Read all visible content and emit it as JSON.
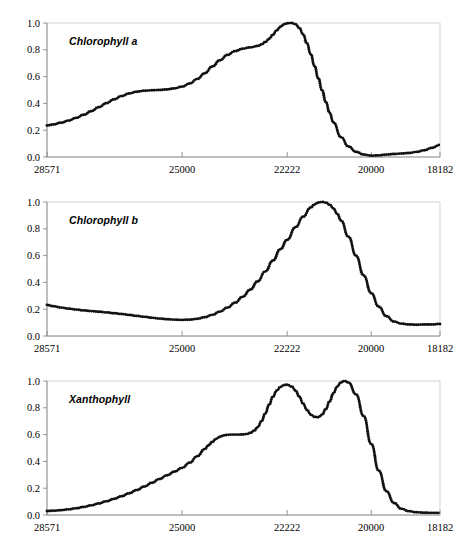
{
  "figure": {
    "background_color": "#ffffff",
    "marker_color": "#111111",
    "axis_color": "#8a8a8a",
    "frame_color": "#c8c8c8",
    "panel_count": 3
  },
  "chart_data": [
    {
      "type": "line",
      "title": "Chlorophyll a",
      "xlabel": "",
      "ylabel": "",
      "xlim": [
        28571,
        18182
      ],
      "ylim": [
        0.0,
        1.0
      ],
      "x_ticks": [
        28571,
        25000,
        22222,
        20000,
        18182
      ],
      "x_tick_labels": [
        "28571",
        "25000",
        "22222",
        "20000",
        "18182"
      ],
      "y_ticks": [
        0.0,
        0.2,
        0.4,
        0.6,
        0.8,
        1.0
      ],
      "y_tick_labels": [
        "0.0",
        "0.2",
        "0.4",
        "0.6",
        "0.8",
        "1.0"
      ],
      "grid": false,
      "legend": "none",
      "marker": "open-circle",
      "x_reversed": true,
      "x": [
        28571,
        28400,
        28200,
        28000,
        27800,
        27600,
        27400,
        27200,
        27000,
        26800,
        26600,
        26400,
        26200,
        26000,
        25800,
        25600,
        25400,
        25200,
        25000,
        24800,
        24600,
        24400,
        24200,
        24000,
        23800,
        23600,
        23400,
        23200,
        23000,
        22900,
        22800,
        22700,
        22600,
        22500,
        22400,
        22300,
        22222,
        22100,
        22000,
        21900,
        21800,
        21700,
        21600,
        21500,
        21400,
        21300,
        21200,
        21100,
        21000,
        20800,
        20600,
        20400,
        20200,
        20000,
        19800,
        19600,
        19400,
        19200,
        19000,
        18800,
        18600,
        18400,
        18182
      ],
      "values": [
        0.235,
        0.243,
        0.256,
        0.272,
        0.292,
        0.315,
        0.342,
        0.372,
        0.402,
        0.43,
        0.455,
        0.474,
        0.487,
        0.494,
        0.498,
        0.5,
        0.504,
        0.512,
        0.525,
        0.548,
        0.582,
        0.625,
        0.675,
        0.722,
        0.762,
        0.79,
        0.808,
        0.818,
        0.828,
        0.84,
        0.858,
        0.882,
        0.912,
        0.945,
        0.972,
        0.99,
        0.998,
        1.0,
        0.99,
        0.962,
        0.915,
        0.848,
        0.768,
        0.68,
        0.588,
        0.498,
        0.41,
        0.33,
        0.258,
        0.148,
        0.078,
        0.038,
        0.018,
        0.01,
        0.012,
        0.018,
        0.022,
        0.026,
        0.03,
        0.038,
        0.05,
        0.068,
        0.09
      ]
    },
    {
      "type": "line",
      "title": "Chlorophyll b",
      "xlabel": "",
      "ylabel": "",
      "xlim": [
        28571,
        18182
      ],
      "ylim": [
        0.0,
        1.0
      ],
      "x_ticks": [
        28571,
        25000,
        22222,
        20000,
        18182
      ],
      "x_tick_labels": [
        "28571",
        "25000",
        "22222",
        "20000",
        "18182"
      ],
      "y_ticks": [
        0.0,
        0.2,
        0.4,
        0.6,
        0.8,
        1.0
      ],
      "y_tick_labels": [
        "0.0",
        "0.2",
        "0.4",
        "0.6",
        "0.8",
        "1.0"
      ],
      "grid": false,
      "legend": "none",
      "marker": "open-circle",
      "x_reversed": true,
      "x": [
        28571,
        28400,
        28200,
        28000,
        27800,
        27600,
        27400,
        27200,
        27000,
        26800,
        26600,
        26400,
        26200,
        26000,
        25800,
        25600,
        25400,
        25200,
        25000,
        24800,
        24600,
        24400,
        24200,
        24000,
        23800,
        23600,
        23400,
        23200,
        23000,
        22800,
        22600,
        22400,
        22222,
        22000,
        21800,
        21600,
        21500,
        21400,
        21300,
        21200,
        21100,
        21000,
        20900,
        20800,
        20600,
        20400,
        20200,
        20000,
        19800,
        19600,
        19400,
        19200,
        19000,
        18800,
        18600,
        18400,
        18182
      ],
      "values": [
        0.232,
        0.222,
        0.212,
        0.204,
        0.197,
        0.191,
        0.186,
        0.181,
        0.176,
        0.17,
        0.164,
        0.157,
        0.15,
        0.143,
        0.136,
        0.13,
        0.125,
        0.122,
        0.12,
        0.122,
        0.128,
        0.14,
        0.158,
        0.182,
        0.212,
        0.248,
        0.292,
        0.345,
        0.408,
        0.482,
        0.562,
        0.648,
        0.718,
        0.812,
        0.89,
        0.958,
        0.982,
        0.996,
        1.0,
        0.995,
        0.98,
        0.952,
        0.912,
        0.862,
        0.74,
        0.598,
        0.452,
        0.32,
        0.218,
        0.148,
        0.108,
        0.092,
        0.086,
        0.084,
        0.086,
        0.086,
        0.09
      ]
    },
    {
      "type": "line",
      "title": "Xanthophyll",
      "xlabel": "",
      "ylabel": "",
      "xlim": [
        28571,
        18182
      ],
      "ylim": [
        0.0,
        1.0
      ],
      "x_ticks": [
        28571,
        25000,
        22222,
        20000,
        18182
      ],
      "x_tick_labels": [
        "28571",
        "25000",
        "22222",
        "20000",
        "18182"
      ],
      "y_ticks": [
        0.0,
        0.2,
        0.4,
        0.6,
        0.8,
        1.0
      ],
      "y_tick_labels": [
        "0.0",
        "0.2",
        "0.4",
        "0.6",
        "0.8",
        "1.0"
      ],
      "grid": false,
      "legend": "none",
      "marker": "open-circle",
      "x_reversed": true,
      "x": [
        28571,
        28400,
        28200,
        28000,
        27800,
        27600,
        27400,
        27200,
        27000,
        26800,
        26600,
        26400,
        26200,
        26000,
        25800,
        25600,
        25400,
        25200,
        25000,
        24800,
        24600,
        24400,
        24300,
        24200,
        24100,
        24000,
        23900,
        23800,
        23700,
        23600,
        23500,
        23400,
        23300,
        23200,
        23100,
        23000,
        22900,
        22800,
        22700,
        22600,
        22500,
        22400,
        22300,
        22222,
        22100,
        22000,
        21900,
        21800,
        21700,
        21600,
        21500,
        21400,
        21300,
        21200,
        21100,
        21000,
        20900,
        20800,
        20700,
        20600,
        20400,
        20200,
        20000,
        19800,
        19600,
        19400,
        19200,
        19000,
        18800,
        18600,
        18400,
        18182
      ],
      "values": [
        0.03,
        0.032,
        0.036,
        0.042,
        0.05,
        0.06,
        0.072,
        0.086,
        0.102,
        0.12,
        0.14,
        0.162,
        0.186,
        0.212,
        0.24,
        0.268,
        0.296,
        0.324,
        0.352,
        0.39,
        0.438,
        0.492,
        0.52,
        0.546,
        0.568,
        0.584,
        0.594,
        0.598,
        0.6,
        0.6,
        0.6,
        0.601,
        0.604,
        0.612,
        0.628,
        0.656,
        0.7,
        0.758,
        0.822,
        0.882,
        0.928,
        0.956,
        0.97,
        0.972,
        0.958,
        0.928,
        0.882,
        0.83,
        0.784,
        0.75,
        0.732,
        0.73,
        0.748,
        0.79,
        0.848,
        0.908,
        0.958,
        0.99,
        1.0,
        0.988,
        0.9,
        0.738,
        0.53,
        0.33,
        0.178,
        0.09,
        0.046,
        0.028,
        0.02,
        0.017,
        0.016,
        0.016
      ]
    }
  ]
}
